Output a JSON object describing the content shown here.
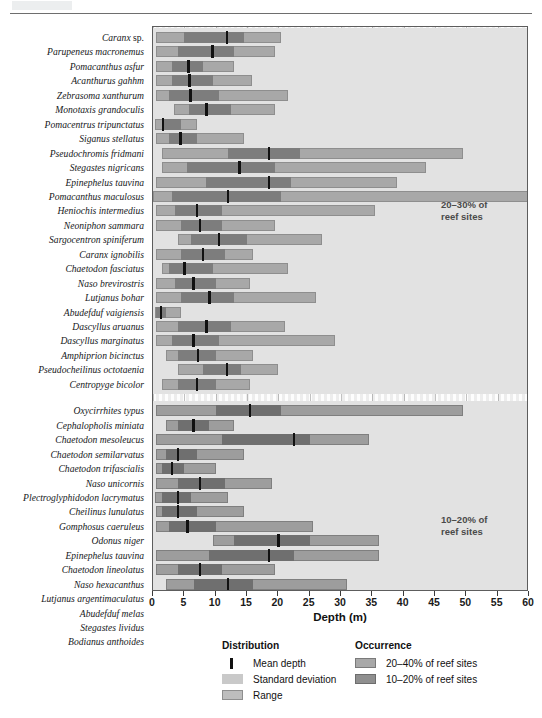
{
  "axis": {
    "title": "Depth (m)",
    "ticks": [
      0,
      5,
      10,
      15,
      20,
      25,
      30,
      35,
      40,
      45,
      50,
      55,
      60
    ],
    "min": 0,
    "max": 60
  },
  "bands": [
    {
      "label": "20–30% of\nreef sites",
      "line1": "20–30% of",
      "line2": "reef sites"
    },
    {
      "label": "10–20% of\nreef sites",
      "line1": "10–20% of",
      "line2": "reef sites"
    }
  ],
  "legend": {
    "distribution": {
      "title": "Distribution",
      "items": [
        {
          "swatch": "mean-depth-swatch",
          "label": "Mean depth"
        },
        {
          "swatch": "standard-deviation-swatch",
          "label": "Standard deviation"
        },
        {
          "swatch": "range-swatch",
          "label": "Range"
        }
      ]
    },
    "occurrence": {
      "title": "Occurrence",
      "items": [
        {
          "swatch": "occurrence-high-swatch",
          "label": "20–40% of reef sites"
        },
        {
          "swatch": "occurrence-low-swatch",
          "label": "10–20% of reef sites"
        }
      ]
    }
  },
  "colors": {
    "range": "#a8a8a8",
    "sd": "#7d7d7d",
    "mean": "#111111",
    "range_low": "#9d9d9d",
    "sd_low": "#6f6f6f",
    "band": "#e2e2e2",
    "plot_bg": "#f2f2f2"
  },
  "chart_data": {
    "type": "bar",
    "title": "",
    "xlabel": "Depth (m)",
    "ylabel": "",
    "xlim": [
      0,
      60
    ],
    "grid": true,
    "legend_position": "bottom",
    "value_keys": [
      "range_min",
      "range_max",
      "sd_min",
      "sd_max",
      "mean"
    ],
    "groups": [
      {
        "name": "20–40% of reef sites",
        "band_label": "20–30% of reef sites",
        "species": [
          {
            "label": "Caranx sp.",
            "italic_part": "Caranx",
            "plain_part": "sp.",
            "range_min": 0.5,
            "range_max": 20.5,
            "sd_min": 5.0,
            "sd_max": 14.5,
            "mean": 11.8
          },
          {
            "label": "Parupeneus macronemus",
            "range_min": 0.5,
            "range_max": 19.5,
            "sd_min": 4.0,
            "sd_max": 13.0,
            "mean": 9.5
          },
          {
            "label": "Pomacanthus asfur",
            "range_min": 0.5,
            "range_max": 13.0,
            "sd_min": 3.0,
            "sd_max": 8.0,
            "mean": 5.7
          },
          {
            "label": "Acanthurus gahhm",
            "range_min": 0.5,
            "range_max": 15.8,
            "sd_min": 3.0,
            "sd_max": 9.5,
            "mean": 5.8
          },
          {
            "label": "Zebrasoma xanthurum",
            "range_min": 0.5,
            "range_max": 21.5,
            "sd_min": 2.5,
            "sd_max": 10.5,
            "mean": 6.0
          },
          {
            "label": "Monotaxis grandoculis",
            "range_min": 3.3,
            "range_max": 19.5,
            "sd_min": 5.8,
            "sd_max": 12.5,
            "mean": 8.5
          },
          {
            "label": "Pomacentrus tripunctatus",
            "range_min": 0.3,
            "range_max": 7.0,
            "sd_min": 1.5,
            "sd_max": 4.5,
            "mean": 1.6
          },
          {
            "label": "Siganus stellatus",
            "range_min": 0.5,
            "range_max": 14.5,
            "sd_min": 2.5,
            "sd_max": 7.0,
            "mean": 4.4
          },
          {
            "label": "Pseudochromis fridmani",
            "range_min": 1.5,
            "range_max": 49.5,
            "sd_min": 12.0,
            "sd_max": 23.5,
            "mean": 18.5
          },
          {
            "label": "Stegastes nigricans",
            "range_min": 1.5,
            "range_max": 43.5,
            "sd_min": 5.5,
            "sd_max": 19.5,
            "mean": 13.8
          },
          {
            "label": "Epinephelus tauvina",
            "range_min": 0.5,
            "range_max": 39.0,
            "sd_min": 8.5,
            "sd_max": 22.0,
            "mean": 18.5
          },
          {
            "label": "Pomacanthus maculosus",
            "range_min": 0.0,
            "range_max": 60.0,
            "sd_min": 3.0,
            "sd_max": 20.5,
            "mean": 12.0
          },
          {
            "label": "Heniochis intermedius",
            "range_min": 0.5,
            "range_max": 35.5,
            "sd_min": 3.5,
            "sd_max": 11.0,
            "mean": 7.0
          },
          {
            "label": "Neoniphon sammara",
            "range_min": 0.5,
            "range_max": 19.5,
            "sd_min": 4.5,
            "sd_max": 11.0,
            "mean": 7.5
          },
          {
            "label": "Sargocentron spiniferum",
            "range_min": 4.0,
            "range_max": 27.0,
            "sd_min": 6.0,
            "sd_max": 15.0,
            "mean": 10.5
          },
          {
            "label": "Caranx ignobilis",
            "range_min": 0.5,
            "range_max": 16.0,
            "sd_min": 4.5,
            "sd_max": 11.5,
            "mean": 8.0
          },
          {
            "label": "Chaetodon fasciatus",
            "range_min": 1.5,
            "range_max": 21.5,
            "sd_min": 2.5,
            "sd_max": 9.5,
            "mean": 5.0
          },
          {
            "label": "Naso brevirostris",
            "range_min": 0.5,
            "range_max": 15.5,
            "sd_min": 3.5,
            "sd_max": 10.0,
            "mean": 6.5
          },
          {
            "label": "Lutjanus bohar",
            "range_min": 0.5,
            "range_max": 26.0,
            "sd_min": 4.5,
            "sd_max": 13.0,
            "mean": 9.0
          },
          {
            "label": "Abudefduf vaigiensis",
            "range_min": 0.3,
            "range_max": 4.5,
            "sd_min": 0.5,
            "sd_max": 2.0,
            "mean": 1.3
          },
          {
            "label": "Dascyllus aruanus",
            "range_min": 0.5,
            "range_max": 21.0,
            "sd_min": 4.0,
            "sd_max": 12.5,
            "mean": 8.5
          },
          {
            "label": "Dascyllus marginatus",
            "range_min": 0.5,
            "range_max": 29.0,
            "sd_min": 3.0,
            "sd_max": 10.5,
            "mean": 6.5
          },
          {
            "label": "Amphiprion bicinctus",
            "range_min": 2.0,
            "range_max": 16.0,
            "sd_min": 4.0,
            "sd_max": 10.0,
            "mean": 7.2
          },
          {
            "label": "Pseudocheilinus octotaenia",
            "range_min": 4.0,
            "range_max": 20.0,
            "sd_min": 8.0,
            "sd_max": 14.0,
            "mean": 11.8
          },
          {
            "label": "Centropyge bicolor",
            "range_min": 1.5,
            "range_max": 15.5,
            "sd_min": 4.0,
            "sd_max": 10.0,
            "mean": 7.0
          }
        ]
      },
      {
        "name": "10–20% of reef sites",
        "band_label": "10–20% of reef sites",
        "species": [
          {
            "label": "Oxycirrhites typus",
            "range_min": 0.5,
            "range_max": 49.5,
            "sd_min": 10.0,
            "sd_max": 20.5,
            "mean": 15.5
          },
          {
            "label": "Cephalopholis miniata",
            "range_min": 2.0,
            "range_max": 13.0,
            "sd_min": 4.0,
            "sd_max": 9.0,
            "mean": 6.5
          },
          {
            "label": "Chaetodon mesoleucus",
            "range_min": 0.5,
            "range_max": 34.5,
            "sd_min": 11.0,
            "sd_max": 25.0,
            "mean": 22.5
          },
          {
            "label": "Chaetodon semilarvatus",
            "range_min": 0.5,
            "range_max": 14.5,
            "sd_min": 2.0,
            "sd_max": 7.0,
            "mean": 4.0
          },
          {
            "label": "Chaetodon trifascialis",
            "range_min": 0.5,
            "range_max": 10.0,
            "sd_min": 1.5,
            "sd_max": 5.0,
            "mean": 3.0
          },
          {
            "label": "Naso unicornis",
            "range_min": 0.5,
            "range_max": 19.0,
            "sd_min": 4.0,
            "sd_max": 11.5,
            "mean": 7.5
          },
          {
            "label": "Plectroglyphidodon lacrymatus",
            "range_min": 0.3,
            "range_max": 12.0,
            "sd_min": 1.5,
            "sd_max": 6.0,
            "mean": 4.0
          },
          {
            "label": "Cheilinus lunulatus",
            "range_min": 0.5,
            "range_max": 14.5,
            "sd_min": 1.5,
            "sd_max": 7.0,
            "mean": 4.0
          },
          {
            "label": "Gomphosus caeruleus",
            "range_min": 0.5,
            "range_max": 25.5,
            "sd_min": 2.5,
            "sd_max": 10.0,
            "mean": 5.5
          },
          {
            "label": "Odonus niger",
            "range_min": 9.5,
            "range_max": 36.0,
            "sd_min": 13.0,
            "sd_max": 25.0,
            "mean": 20.0
          },
          {
            "label": "Epinephelus tauvina",
            "range_min": 0.5,
            "range_max": 36.0,
            "sd_min": 9.0,
            "sd_max": 22.5,
            "mean": 18.5
          },
          {
            "label": "Chaetodon lineolatus",
            "range_min": 0.5,
            "range_max": 19.5,
            "sd_min": 4.0,
            "sd_max": 11.0,
            "mean": 7.5
          },
          {
            "label": "Naso hexacanthus",
            "range_min": 2.0,
            "range_max": 31.0,
            "sd_min": 6.5,
            "sd_max": 16.0,
            "mean": 12.0
          },
          {
            "label": "Lutjanus argentimaculatus",
            "range_min": 0.5,
            "range_max": 36.0,
            "sd_min": 5.0,
            "sd_max": 17.0,
            "mean": 12.0
          },
          {
            "label": "Abudefduf melas",
            "range_min": 0.5,
            "range_max": 9.5,
            "sd_min": 2.5,
            "sd_max": 6.5,
            "mean": 4.0
          },
          {
            "label": "Stegastes lividus",
            "range_min": 0.5,
            "range_max": 44.5,
            "sd_min": 2.0,
            "sd_max": 22.5,
            "mean": 12.0
          },
          {
            "label": "Bodianus anthoides",
            "range_min": 5.0,
            "range_max": 37.0,
            "sd_min": 22.0,
            "sd_max": 30.5,
            "mean": 26.0
          }
        ]
      }
    ]
  }
}
